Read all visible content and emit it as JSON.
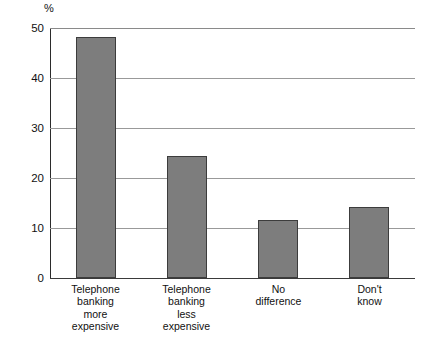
{
  "chart_data": {
    "type": "bar",
    "title": "",
    "subtitle": "",
    "xlabel": "",
    "ylabel": "%",
    "ylim": [
      0,
      50
    ],
    "yticks": [
      0,
      10,
      20,
      30,
      40,
      50
    ],
    "ytick_labels": [
      "0",
      "10",
      "20",
      "30",
      "40",
      "50"
    ],
    "grid": true,
    "legend": null,
    "categories": [
      "Telephone banking more expensive",
      "Telephone banking less expensive",
      "No difference",
      "Don't know"
    ],
    "category_lines": [
      [
        "Telephone",
        "banking",
        "more",
        "expensive"
      ],
      [
        "Telephone",
        "banking",
        "less",
        "expensive"
      ],
      [
        "No",
        "difference"
      ],
      [
        "Don't",
        "know"
      ]
    ],
    "values": [
      48.2,
      24.3,
      11.6,
      14.2
    ],
    "bar_color": "#7d7d7d",
    "bar_border_color": "#3c3c3c",
    "gridline_color": "#999999",
    "axis_color": "#2b2b2b",
    "background": "#ffffff"
  },
  "axis": {
    "unit_label": "%"
  }
}
